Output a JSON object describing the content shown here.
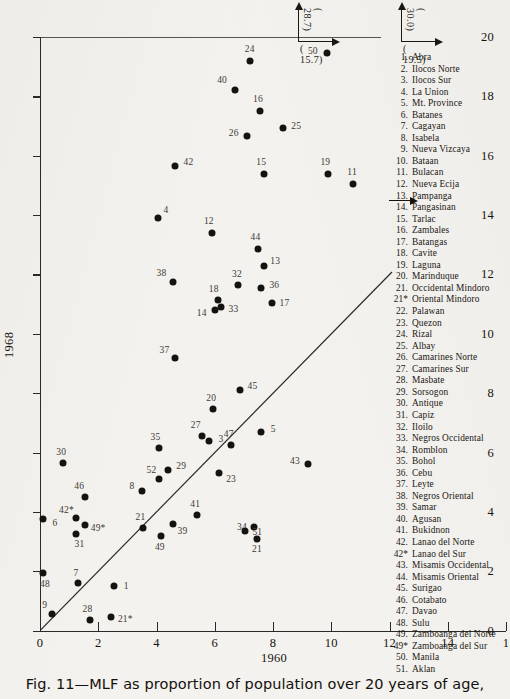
{
  "caption": "Fig. 11—MLF as proportion of population over 20 years of age,",
  "axes": {
    "xlabel": "1960",
    "ylabel": "1968",
    "xticks": [
      "0",
      "2",
      "4",
      "6",
      "8",
      "10",
      "12",
      "14",
      "1"
    ],
    "yticks": [
      "0",
      "2",
      "4",
      "6",
      "8",
      "10",
      "12",
      "14",
      "16",
      "18",
      "20"
    ],
    "xlim": [
      0,
      16
    ],
    "ylim": [
      0,
      20
    ]
  },
  "offchart_notes": [
    {
      "name": "note-24",
      "vertical": "( 28.7)",
      "horizontal": "( 15.7)"
    },
    {
      "name": "note-50",
      "vertical": "( 30.0)",
      "horizontal": "( 19.5)"
    }
  ],
  "chart_data": {
    "type": "scatter",
    "title": "Fig. 11—MLF as proportion of population over 20 years of age,",
    "xlabel": "1960",
    "ylabel": "1968",
    "xlim": [
      0,
      16
    ],
    "ylim": [
      0,
      20
    ],
    "grid": false,
    "legend_position": "right",
    "reference_line": {
      "label": "45-degree line",
      "from": [
        0,
        0
      ],
      "to": [
        12.1,
        12.1
      ]
    },
    "annotations": [
      {
        "point": "24",
        "text": "( 15.7)",
        "text2": "( 28.7)",
        "meaning": "true value off chart at x=15.7, y=28.7"
      },
      {
        "point": "50",
        "text": "( 19.5)",
        "text2": "( 30.0)",
        "meaning": "true value off chart at x=19.5, y=30.0"
      },
      {
        "point": "11",
        "text": "arrow-right",
        "meaning": "value extends beyond plotted position"
      }
    ],
    "points": [
      {
        "label": "24",
        "x": 7.2,
        "y": 19.2
      },
      {
        "label": "50",
        "x": 9.85,
        "y": 19.45
      },
      {
        "label": "40",
        "x": 6.7,
        "y": 18.2
      },
      {
        "label": "16",
        "x": 7.55,
        "y": 17.5
      },
      {
        "label": "25",
        "x": 8.35,
        "y": 16.95
      },
      {
        "label": "26",
        "x": 7.1,
        "y": 16.65
      },
      {
        "label": "42",
        "x": 4.65,
        "y": 15.65
      },
      {
        "label": "15",
        "x": 7.7,
        "y": 15.4
      },
      {
        "label": "19",
        "x": 9.9,
        "y": 15.4
      },
      {
        "label": "11",
        "x": 10.75,
        "y": 15.05
      },
      {
        "label": "4",
        "x": 4.05,
        "y": 13.9
      },
      {
        "label": "12",
        "x": 5.9,
        "y": 13.4
      },
      {
        "label": "44",
        "x": 7.5,
        "y": 12.85
      },
      {
        "label": "13",
        "x": 7.7,
        "y": 12.3
      },
      {
        "label": "38",
        "x": 4.55,
        "y": 11.75
      },
      {
        "label": "32",
        "x": 6.8,
        "y": 11.65
      },
      {
        "label": "36",
        "x": 7.6,
        "y": 11.55
      },
      {
        "label": "18",
        "x": 6.1,
        "y": 11.15
      },
      {
        "label": "17",
        "x": 7.95,
        "y": 11.05
      },
      {
        "label": "33",
        "x": 6.2,
        "y": 10.9
      },
      {
        "label": "14",
        "x": 6.0,
        "y": 10.8
      },
      {
        "label": "37",
        "x": 4.65,
        "y": 9.2
      },
      {
        "label": "45",
        "x": 6.85,
        "y": 8.1
      },
      {
        "label": "20",
        "x": 5.95,
        "y": 7.45
      },
      {
        "label": "5",
        "x": 7.6,
        "y": 6.7
      },
      {
        "label": "27",
        "x": 5.55,
        "y": 6.55
      },
      {
        "label": "3",
        "x": 5.8,
        "y": 6.4
      },
      {
        "label": "47",
        "x": 6.55,
        "y": 6.25
      },
      {
        "label": "35",
        "x": 4.1,
        "y": 6.15
      },
      {
        "label": "30",
        "x": 0.8,
        "y": 5.65
      },
      {
        "label": "43",
        "x": 9.2,
        "y": 5.6
      },
      {
        "label": "29",
        "x": 4.4,
        "y": 5.4
      },
      {
        "label": "23",
        "x": 6.15,
        "y": 5.3
      },
      {
        "label": "52",
        "x": 4.1,
        "y": 5.1
      },
      {
        "label": "8",
        "x": 3.5,
        "y": 4.7
      },
      {
        "label": "46",
        "x": 1.55,
        "y": 4.5
      },
      {
        "label": "41",
        "x": 5.4,
        "y": 3.9
      },
      {
        "label": "42*",
        "x": 1.25,
        "y": 3.8
      },
      {
        "label": "6",
        "x": 0.1,
        "y": 3.75
      },
      {
        "label": "39",
        "x": 4.55,
        "y": 3.6
      },
      {
        "label": "49*",
        "x": 1.55,
        "y": 3.55
      },
      {
        "label": "34",
        "x": 7.35,
        "y": 3.5
      },
      {
        "label": "21",
        "x": 3.55,
        "y": 3.45
      },
      {
        "label": "51",
        "x": 7.05,
        "y": 3.35
      },
      {
        "label": "31",
        "x": 1.25,
        "y": 3.25
      },
      {
        "label": "49",
        "x": 4.15,
        "y": 3.2
      },
      {
        "label": "21b",
        "x": 7.45,
        "y": 3.1
      },
      {
        "label": "48",
        "x": 0.1,
        "y": 1.95
      },
      {
        "label": "7",
        "x": 1.3,
        "y": 1.6
      },
      {
        "label": "1",
        "x": 2.55,
        "y": 1.5
      },
      {
        "label": "9",
        "x": 0.4,
        "y": 0.55
      },
      {
        "label": "28",
        "x": 1.7,
        "y": 0.35
      },
      {
        "label": "21*",
        "x": 2.45,
        "y": 0.45
      }
    ]
  },
  "legend": {
    "items": [
      {
        "num": "1.",
        "name": "Abra"
      },
      {
        "num": "2.",
        "name": "Ilocos Norte"
      },
      {
        "num": "3.",
        "name": "Ilocos Sur"
      },
      {
        "num": "4.",
        "name": "La Union"
      },
      {
        "num": "5.",
        "name": "Mt. Province"
      },
      {
        "num": "6.",
        "name": "Batanes"
      },
      {
        "num": "7.",
        "name": "Cagayan"
      },
      {
        "num": "8.",
        "name": "Isabela"
      },
      {
        "num": "9.",
        "name": "Nueva Vizcaya"
      },
      {
        "num": "10.",
        "name": "Bataan"
      },
      {
        "num": "11.",
        "name": "Bulacan"
      },
      {
        "num": "12.",
        "name": "Nueva Ecija"
      },
      {
        "num": "13.",
        "name": "Pampanga"
      },
      {
        "num": "14.",
        "name": "Pangasinan"
      },
      {
        "num": "15.",
        "name": "Tarlac"
      },
      {
        "num": "16.",
        "name": "Zambales"
      },
      {
        "num": "17.",
        "name": "Batangas"
      },
      {
        "num": "18.",
        "name": "Cavite"
      },
      {
        "num": "19.",
        "name": "Laguna"
      },
      {
        "num": "20.",
        "name": "Marinduque"
      },
      {
        "num": "21.",
        "name": "Occidental Mindoro"
      },
      {
        "num": "21*",
        "name": "Oriental Mindoro"
      },
      {
        "num": "22.",
        "name": "Palawan"
      },
      {
        "num": "23.",
        "name": "Quezon"
      },
      {
        "num": "24.",
        "name": "Rizal"
      },
      {
        "num": "25.",
        "name": "Albay"
      },
      {
        "num": "26.",
        "name": "Camarines Norte"
      },
      {
        "num": "27.",
        "name": "Camarines Sur"
      },
      {
        "num": "28.",
        "name": "Masbate"
      },
      {
        "num": "29.",
        "name": "Sorsogon"
      },
      {
        "num": "30.",
        "name": "Antique"
      },
      {
        "num": "31.",
        "name": "Capiz"
      },
      {
        "num": "32.",
        "name": "Iloilo"
      },
      {
        "num": "33.",
        "name": "Negros Occidental"
      },
      {
        "num": "34.",
        "name": "Romblon"
      },
      {
        "num": "35.",
        "name": "Bohol"
      },
      {
        "num": "36.",
        "name": "Cebu"
      },
      {
        "num": "37.",
        "name": "Leyte"
      },
      {
        "num": "38.",
        "name": "Negros Oriental"
      },
      {
        "num": "39.",
        "name": "Samar"
      },
      {
        "num": "40.",
        "name": "Agusan"
      },
      {
        "num": "41.",
        "name": "Bukidnon"
      },
      {
        "num": "42.",
        "name": "Lanao del Norte"
      },
      {
        "num": "42*",
        "name": "Lanao del Sur"
      },
      {
        "num": "43.",
        "name": "Misamis Occidental"
      },
      {
        "num": "44.",
        "name": "Misamis Oriental"
      },
      {
        "num": "45.",
        "name": "Surigao"
      },
      {
        "num": "46.",
        "name": "Cotabato"
      },
      {
        "num": "47.",
        "name": "Davao"
      },
      {
        "num": "48.",
        "name": "Sulu"
      },
      {
        "num": "49.",
        "name": "Zamboanga del Norte"
      },
      {
        "num": "49*",
        "name": "Zamboanga del Sur"
      },
      {
        "num": "50.",
        "name": "Manila"
      },
      {
        "num": "51.",
        "name": "Aklan"
      }
    ]
  }
}
